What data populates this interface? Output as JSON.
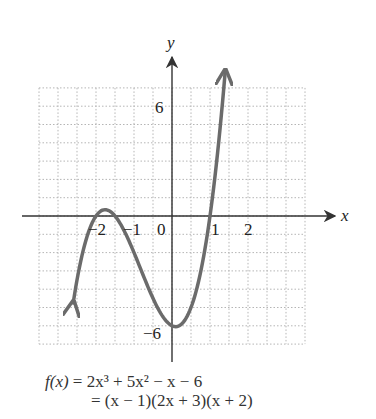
{
  "chart_data": {
    "type": "line",
    "title": "",
    "function": "f(x) = 2x^3 + 5x^2 - x - 6",
    "factored": "(x - 1)(2x + 3)(x + 2)",
    "xlabel": "x",
    "ylabel": "y",
    "xlim": [
      -3.5,
      3.5
    ],
    "ylim": [
      -7,
      7
    ],
    "grid": true,
    "grid_step_x": 0.5,
    "grid_step_y": 1,
    "x_tick_labels": [
      "-2",
      "-1",
      "0",
      "1",
      "2"
    ],
    "y_tick_labels": [
      "6",
      "-6"
    ],
    "zeros": [
      -2,
      -1.5,
      1
    ],
    "y_intercept": -6,
    "series": [
      {
        "name": "f(x)",
        "x": [
          -2.6,
          -2.5,
          -2.25,
          -2,
          -1.75,
          -1.5,
          -1.25,
          -1,
          -0.75,
          -0.5,
          -0.25,
          0,
          0.25,
          0.5,
          0.75,
          1,
          1.25,
          1.4
        ],
        "values": [
          -6.43,
          -4.5,
          -1.84,
          0,
          0.47,
          0,
          -1.09,
          -2,
          -2.78,
          -3.5,
          -4.47,
          -6,
          -5.91,
          -4.5,
          -2.34,
          0,
          2.47,
          7.18
        ]
      }
    ]
  },
  "labels": {
    "y_axis": "y",
    "x_axis": "x",
    "tick_6": "6",
    "tick_neg6": "−6",
    "tick_neg2": "−2",
    "tick_neg1": "−1",
    "tick_0": "0",
    "tick_1": "1",
    "tick_2": "2"
  },
  "formula": {
    "line1_lhs": "f(x)",
    "line1_rhs": " = 2x³ + 5x² − x − 6",
    "line2": "= (x − 1)(2x + 3)(x + 2)"
  },
  "colors": {
    "curve": "#6b6b6b",
    "axis": "#333333",
    "grid": "#b5b5b5"
  }
}
